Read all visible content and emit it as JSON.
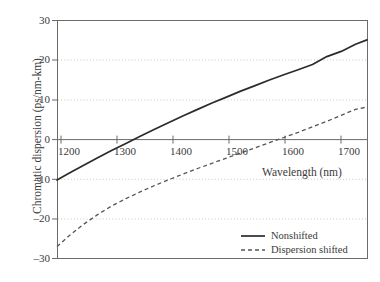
{
  "chart_data": {
    "type": "line",
    "title": "",
    "xlabel": "Wavelength (nm)",
    "ylabel": "Chromatic dispersion (ps/nm-km)",
    "xlim": [
      1180,
      1720
    ],
    "ylim": [
      -30,
      30
    ],
    "xticks": [
      1200,
      1300,
      1400,
      1500,
      1600,
      1700
    ],
    "xtick_labels": [
      "1200",
      "1300",
      "1400",
      "1500",
      "1600",
      "1700"
    ],
    "yticks": [
      -30,
      -20,
      -10,
      0,
      10,
      20,
      30
    ],
    "ytick_labels": [
      "–30",
      "–20",
      "–10",
      "0",
      "10",
      "20",
      "30"
    ],
    "grid": "horizontal dotted at -20,-10,10,20; solid zero line",
    "legend_position": "bottom-right",
    "series": [
      {
        "name": "Nonshifted",
        "style": "solid",
        "color": "#2b2b2b",
        "x": [
          1180,
          1200,
          1225,
          1250,
          1275,
          1300,
          1325,
          1350,
          1375,
          1400,
          1425,
          1450,
          1475,
          1500,
          1525,
          1550,
          1575,
          1600,
          1625,
          1650,
          1675,
          1700,
          1720
        ],
        "y": [
          -10.2,
          -8.6,
          -6.6,
          -4.7,
          -2.8,
          -1.0,
          0.8,
          2.6,
          4.3,
          6.0,
          7.6,
          9.2,
          10.7,
          12.2,
          13.6,
          15.0,
          16.3,
          17.6,
          18.9,
          20.9,
          22.2,
          24.0,
          25.1
        ]
      },
      {
        "name": "Dispersion shifted",
        "style": "dashed",
        "color": "#555555",
        "x": [
          1180,
          1200,
          1225,
          1250,
          1275,
          1300,
          1325,
          1350,
          1375,
          1400,
          1425,
          1450,
          1475,
          1500,
          1525,
          1550,
          1575,
          1600,
          1625,
          1650,
          1675,
          1700,
          1720
        ],
        "y": [
          -27.0,
          -24.4,
          -21.5,
          -19.0,
          -16.8,
          -14.9,
          -13.2,
          -11.6,
          -10.1,
          -8.7,
          -7.3,
          -6.0,
          -4.7,
          -3.4,
          -2.1,
          -0.8,
          0.5,
          1.8,
          3.2,
          4.6,
          6.1,
          7.6,
          8.2
        ]
      }
    ],
    "legend_entries": [
      {
        "label": "Nonshifted",
        "style": "solid"
      },
      {
        "label": "Dispersion shifted",
        "style": "dashed"
      }
    ],
    "colors": {
      "frame": "#6b6b6b",
      "grid": "#b9b9b9",
      "zero_axis": "#6b6b6b",
      "solid_series": "#2b2b2b",
      "dashed_series": "#555555",
      "text": "#3a3a3a",
      "background": "#ffffff"
    }
  }
}
